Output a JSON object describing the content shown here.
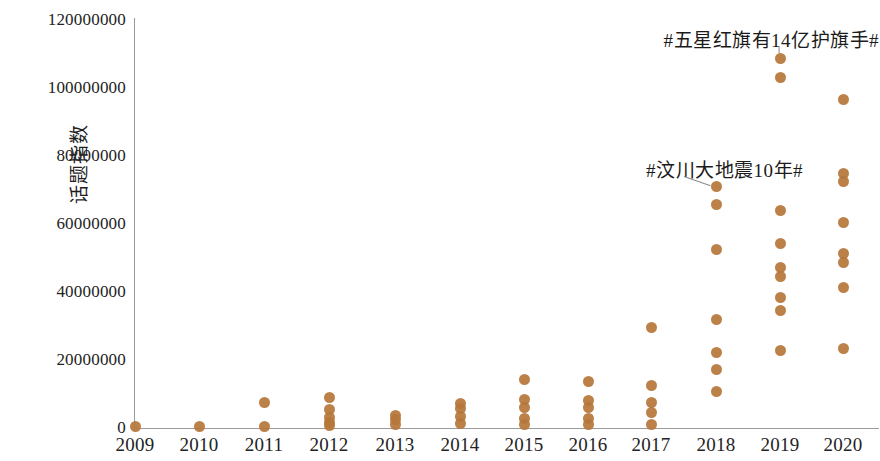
{
  "chart_data": {
    "type": "scatter",
    "title": "",
    "subtitle": "",
    "xlabel": "",
    "ylabel": "话题指数",
    "xlim": [
      2008.5,
      2020.5
    ],
    "ylim": [
      0,
      120000000
    ],
    "grid": false,
    "legend": null,
    "x_tick_labels": [
      "2009",
      "2010",
      "2011",
      "2012",
      "2013",
      "2014",
      "2015",
      "2016",
      "2017",
      "2018",
      "2019",
      "2020"
    ],
    "y_tick_labels": [
      "0",
      "20000000",
      "40000000",
      "60000000",
      "80000000",
      "100000000",
      "120000000"
    ],
    "y_tick_values": [
      0,
      20000000,
      40000000,
      60000000,
      80000000,
      100000000,
      120000000
    ],
    "marker_color": "#b5763a",
    "axis_color": "#9b9b9b",
    "series": [
      {
        "name": "话题指数",
        "points": [
          {
            "x": 2009,
            "y": 300000
          },
          {
            "x": 2010,
            "y": 300000
          },
          {
            "x": 2011,
            "y": 7400000
          },
          {
            "x": 2011,
            "y": 400000
          },
          {
            "x": 2012,
            "y": 8900000
          },
          {
            "x": 2012,
            "y": 5300000
          },
          {
            "x": 2012,
            "y": 3200000
          },
          {
            "x": 2012,
            "y": 1500000
          },
          {
            "x": 2012,
            "y": 600000
          },
          {
            "x": 2013,
            "y": 3800000
          },
          {
            "x": 2013,
            "y": 2400000
          },
          {
            "x": 2013,
            "y": 900000
          },
          {
            "x": 2014,
            "y": 7100000
          },
          {
            "x": 2014,
            "y": 5600000
          },
          {
            "x": 2014,
            "y": 3500000
          },
          {
            "x": 2014,
            "y": 1200000
          },
          {
            "x": 2015,
            "y": 14400000
          },
          {
            "x": 2015,
            "y": 8500000
          },
          {
            "x": 2015,
            "y": 5900000
          },
          {
            "x": 2015,
            "y": 2900000
          },
          {
            "x": 2015,
            "y": 900000
          },
          {
            "x": 2016,
            "y": 13800000
          },
          {
            "x": 2016,
            "y": 8200000
          },
          {
            "x": 2016,
            "y": 5900000
          },
          {
            "x": 2016,
            "y": 2900000
          },
          {
            "x": 2016,
            "y": 900000
          },
          {
            "x": 2017,
            "y": 29700000
          },
          {
            "x": 2017,
            "y": 12600000
          },
          {
            "x": 2017,
            "y": 7600000
          },
          {
            "x": 2017,
            "y": 4700000
          },
          {
            "x": 2017,
            "y": 900000
          },
          {
            "x": 2018,
            "y": 70900000
          },
          {
            "x": 2018,
            "y": 65600000
          },
          {
            "x": 2018,
            "y": 52400000
          },
          {
            "x": 2018,
            "y": 31800000
          },
          {
            "x": 2018,
            "y": 22100000
          },
          {
            "x": 2018,
            "y": 17100000
          },
          {
            "x": 2018,
            "y": 10600000
          },
          {
            "x": 2019,
            "y": 108800000
          },
          {
            "x": 2019,
            "y": 103200000
          },
          {
            "x": 2019,
            "y": 64100000
          },
          {
            "x": 2019,
            "y": 54400000
          },
          {
            "x": 2019,
            "y": 47100000
          },
          {
            "x": 2019,
            "y": 44700000
          },
          {
            "x": 2019,
            "y": 38500000
          },
          {
            "x": 2019,
            "y": 34700000
          },
          {
            "x": 2019,
            "y": 22900000
          },
          {
            "x": 2020,
            "y": 96500000
          },
          {
            "x": 2020,
            "y": 75000000
          },
          {
            "x": 2020,
            "y": 72400000
          },
          {
            "x": 2020,
            "y": 60300000
          },
          {
            "x": 2020,
            "y": 51200000
          },
          {
            "x": 2020,
            "y": 48800000
          },
          {
            "x": 2020,
            "y": 41200000
          },
          {
            "x": 2020,
            "y": 23500000
          }
        ]
      }
    ],
    "annotations": [
      {
        "text": "#五星红旗有14亿护旗手#",
        "x": 2019,
        "y": 108800000,
        "label_x_px": 769,
        "label_y_px": 38,
        "align": "right",
        "leader": {
          "x1": 779,
          "y1": 46,
          "x2": 779,
          "y2": 53
        }
      },
      {
        "text": "#汶川大地震10年#",
        "x": 2018,
        "y": 70900000,
        "label_x_px": 693,
        "label_y_px": 168,
        "align": "right",
        "leader": {
          "x1": 684,
          "y1": 176,
          "x2": 710,
          "y2": 185
        }
      }
    ]
  },
  "axes": {
    "y_label": "话题指数",
    "y_ticks": [
      {
        "label": "120000000",
        "top_px": 20
      },
      {
        "label": "100000000",
        "top_px": 88
      },
      {
        "label": "80000000",
        "top_px": 156
      },
      {
        "label": "60000000",
        "top_px": 224
      },
      {
        "label": "40000000",
        "top_px": 292
      },
      {
        "label": "20000000",
        "top_px": 360
      },
      {
        "label": "0",
        "top_px": 428
      }
    ],
    "x_ticks": [
      {
        "label": "2009",
        "left_px": 135
      },
      {
        "label": "2010",
        "left_px": 199
      },
      {
        "label": "2011",
        "left_px": 264
      },
      {
        "label": "2012",
        "left_px": 329
      },
      {
        "label": "2013",
        "left_px": 395
      },
      {
        "label": "2014",
        "left_px": 460
      },
      {
        "label": "2015",
        "left_px": 524
      },
      {
        "label": "2016",
        "left_px": 588
      },
      {
        "label": "2017",
        "left_px": 651
      },
      {
        "label": "2018",
        "left_px": 716
      },
      {
        "label": "2019",
        "left_px": 780
      },
      {
        "label": "2020",
        "left_px": 843
      }
    ]
  }
}
